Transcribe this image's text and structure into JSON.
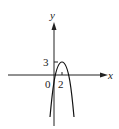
{
  "figure": {
    "type": "function-graph",
    "axes": {
      "x_label": "x",
      "y_label": "y",
      "origin_label": "0",
      "x_tick_label": "2",
      "y_tick_label": "3"
    },
    "curve": {
      "shape": "parabola",
      "opens": "down",
      "vertex": [
        2,
        3
      ],
      "color": "#111111"
    }
  }
}
